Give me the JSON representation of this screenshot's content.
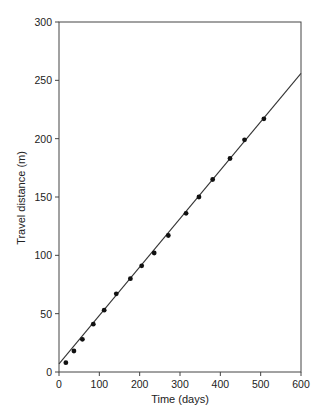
{
  "chart_data": {
    "type": "scatter",
    "title": "",
    "xlabel": "Time (days)",
    "ylabel": "Travel distance (m)",
    "xlim": [
      0,
      600
    ],
    "ylim": [
      0,
      300
    ],
    "xticks": [
      0,
      100,
      200,
      300,
      400,
      500,
      600
    ],
    "yticks": [
      0,
      50,
      100,
      150,
      200,
      250,
      300
    ],
    "grid": false,
    "legend": null,
    "series": [
      {
        "name": "Observed",
        "kind": "points",
        "marker": "filled-circle",
        "color": "#111111",
        "x": [
          17,
          37,
          58,
          85,
          112,
          142,
          177,
          205,
          236,
          271,
          315,
          347,
          381,
          424,
          460,
          508
        ],
        "y": [
          8,
          18,
          28,
          41,
          53,
          67,
          80,
          91,
          102,
          117,
          136,
          150,
          165,
          183,
          199,
          217
        ]
      },
      {
        "name": "Linear fit",
        "kind": "line",
        "color": "#333333",
        "x": [
          0,
          600
        ],
        "y": [
          7,
          256
        ]
      }
    ]
  }
}
